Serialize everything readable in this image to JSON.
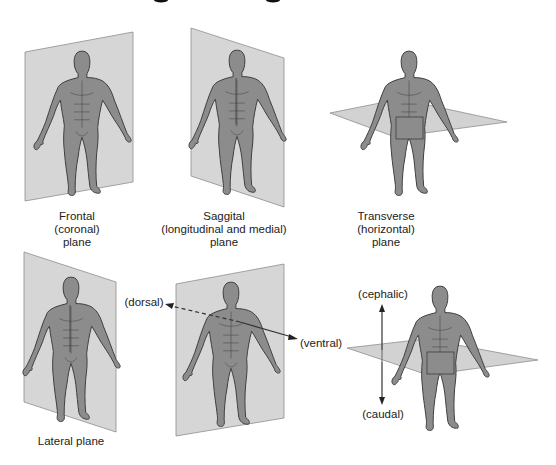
{
  "title_fragment": "cut-off title descenders visible at top edge",
  "colors": {
    "plane_fill": "#d6d6d6",
    "plane_stroke": "#8e8e8e",
    "body_fill": "#8c8c8c",
    "body_outline": "#3c3c3c",
    "text": "#222222"
  },
  "panels": [
    {
      "id": "frontal",
      "label_lines": [
        "Frontal",
        "(coronal)",
        "plane"
      ]
    },
    {
      "id": "sagittal",
      "label_lines": [
        "Saggital",
        "(longitudinal and medial)",
        "plane"
      ]
    },
    {
      "id": "transverse",
      "label_lines": [
        "Transverse",
        "(horizontal)",
        "plane"
      ]
    },
    {
      "id": "lateral",
      "label_lines": [
        "Lateral plane"
      ]
    },
    {
      "id": "dorsal-ventral",
      "arrow_labels": {
        "back": "(dorsal)",
        "front": "(ventral)"
      }
    },
    {
      "id": "cephalic-caudal",
      "arrow_labels": {
        "up": "(cephalic)",
        "down": "(caudal)"
      }
    }
  ]
}
